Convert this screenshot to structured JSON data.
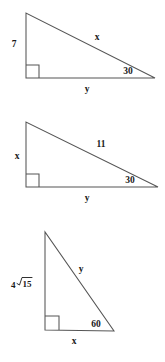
{
  "figure": {
    "background_color": "#ffffff",
    "stroke_color": "#555555",
    "text_color": "#1a1a1a",
    "triangles": [
      {
        "id": "triangle-1",
        "labels": {
          "vertical_leg": "7",
          "hypotenuse": "x",
          "horizontal_leg": "y",
          "angle": "30"
        },
        "right_angle_marker": true
      },
      {
        "id": "triangle-2",
        "labels": {
          "vertical_leg": "x",
          "hypotenuse": "11",
          "horizontal_leg": "y",
          "angle": "30"
        },
        "right_angle_marker": true
      },
      {
        "id": "triangle-3",
        "labels": {
          "vertical_leg_coefficient": "4",
          "vertical_leg_radicand": "15",
          "hypotenuse": "y",
          "horizontal_leg": "x",
          "angle": "60"
        },
        "right_angle_marker": true
      }
    ]
  }
}
